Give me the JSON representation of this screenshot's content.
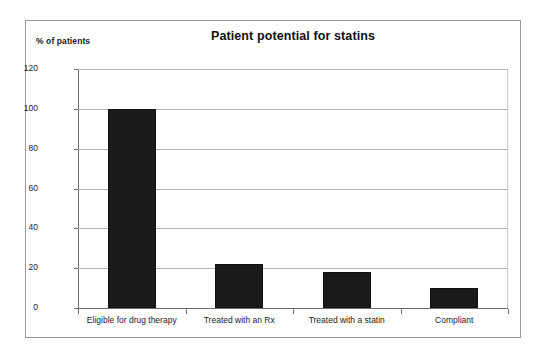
{
  "chart_data": {
    "type": "bar",
    "title": "Patient potential for statins",
    "xlabel": "",
    "ylabel": "% of patients",
    "categories": [
      "Eligible for drug therapy",
      "Treated with an Rx",
      "Treated with a statin",
      "Compliant"
    ],
    "values": [
      100,
      22,
      18,
      10
    ],
    "ylim": [
      0,
      120
    ],
    "yticks": [
      0,
      20,
      40,
      60,
      80,
      100,
      120
    ],
    "ytick_labels": [
      "0",
      "20",
      "40",
      "60",
      "80",
      "100",
      "120"
    ],
    "grid": true,
    "legend": false,
    "series": [
      {
        "name": "% of patients",
        "values": [
          100,
          22,
          18,
          10
        ],
        "color": "#1a1a1a"
      }
    ],
    "colors": {
      "bar": "#1a1a1a",
      "gridline": "#b5b5b5",
      "axis": "#6f6f6f",
      "frame": "#9a9a9a",
      "text": "#1c1c1c",
      "background": "#ffffff"
    }
  }
}
